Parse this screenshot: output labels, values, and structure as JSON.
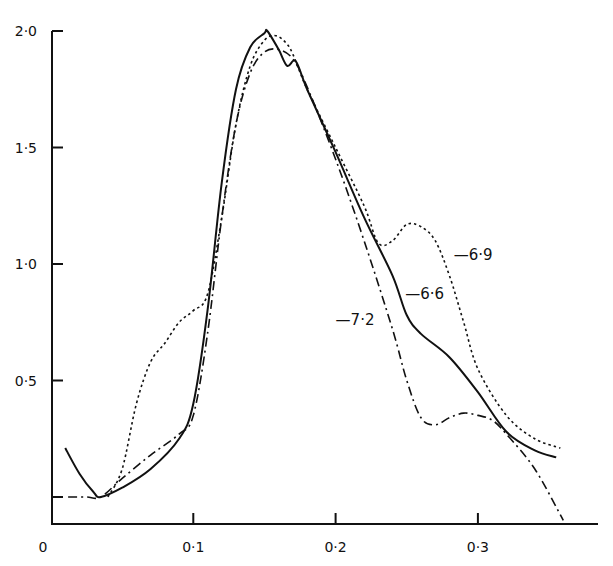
{
  "chart_data": {
    "type": "line",
    "title": "",
    "xlabel": "",
    "ylabel": "",
    "xlim": [
      0,
      0.38
    ],
    "ylim": [
      0,
      2.0
    ],
    "grid": false,
    "legend_position": "inline labels",
    "x_ticks": [
      {
        "value": 0,
        "label": "0"
      },
      {
        "value": 0.1,
        "label": "0·1"
      },
      {
        "value": 0.2,
        "label": "0·2"
      },
      {
        "value": 0.3,
        "label": "0·3"
      }
    ],
    "y_ticks": [
      {
        "value": 0,
        "label": ""
      },
      {
        "value": 0.5,
        "label": "0·5"
      },
      {
        "value": 1.0,
        "label": "1·0"
      },
      {
        "value": 1.5,
        "label": "1·5"
      },
      {
        "value": 2.0,
        "label": "2·0"
      }
    ],
    "series": [
      {
        "name": "6·6",
        "style": "solid",
        "label_pos": {
          "x": 0.249,
          "y": 0.87
        },
        "x": [
          0.01,
          0.02,
          0.03,
          0.035,
          0.05,
          0.07,
          0.09,
          0.1,
          0.11,
          0.12,
          0.13,
          0.14,
          0.15,
          0.152,
          0.16,
          0.166,
          0.172,
          0.18,
          0.2,
          0.22,
          0.24,
          0.25,
          0.26,
          0.28,
          0.3,
          0.32,
          0.34,
          0.355
        ],
        "y": [
          0.21,
          0.1,
          0.02,
          0.0,
          0.04,
          0.12,
          0.25,
          0.4,
          0.8,
          1.35,
          1.75,
          1.93,
          1.99,
          2.0,
          1.92,
          1.85,
          1.87,
          1.75,
          1.48,
          1.2,
          0.95,
          0.78,
          0.7,
          0.6,
          0.45,
          0.28,
          0.2,
          0.17
        ]
      },
      {
        "name": "6·9",
        "style": "dotted",
        "label_pos": {
          "x": 0.283,
          "y": 1.04
        },
        "x": [
          0.04,
          0.05,
          0.06,
          0.07,
          0.08,
          0.09,
          0.1,
          0.11,
          0.12,
          0.13,
          0.14,
          0.15,
          0.158,
          0.165,
          0.17,
          0.18,
          0.2,
          0.22,
          0.23,
          0.24,
          0.25,
          0.26,
          0.27,
          0.28,
          0.29,
          0.3,
          0.32,
          0.34,
          0.358
        ],
        "y": [
          0.0,
          0.12,
          0.4,
          0.58,
          0.66,
          0.75,
          0.8,
          0.87,
          1.2,
          1.6,
          1.85,
          1.96,
          1.98,
          1.95,
          1.9,
          1.75,
          1.5,
          1.25,
          1.09,
          1.1,
          1.17,
          1.16,
          1.1,
          0.95,
          0.75,
          0.55,
          0.35,
          0.25,
          0.21
        ]
      },
      {
        "name": "7·2",
        "style": "dash-dot",
        "label_pos": {
          "x": 0.2,
          "y": 0.76
        },
        "x": [
          0.012,
          0.025,
          0.035,
          0.05,
          0.07,
          0.09,
          0.1,
          0.11,
          0.12,
          0.13,
          0.14,
          0.15,
          0.16,
          0.17,
          0.18,
          0.2,
          0.22,
          0.24,
          0.25,
          0.26,
          0.27,
          0.28,
          0.29,
          0.3,
          0.31,
          0.32,
          0.34,
          0.36
        ],
        "y": [
          0.0,
          0.0,
          0.0,
          0.08,
          0.18,
          0.27,
          0.35,
          0.7,
          1.2,
          1.6,
          1.82,
          1.91,
          1.92,
          1.88,
          1.76,
          1.45,
          1.1,
          0.72,
          0.5,
          0.34,
          0.31,
          0.34,
          0.36,
          0.35,
          0.33,
          0.27,
          0.12,
          -0.1
        ]
      }
    ]
  }
}
